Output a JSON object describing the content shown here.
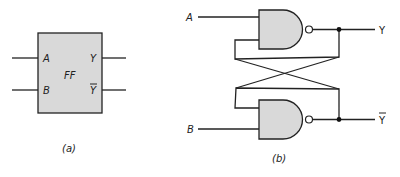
{
  "figure_a": {
    "block_label": "FF",
    "inputs": [
      "A",
      "B"
    ],
    "outputs": [
      "Y",
      "Y̅"
    ],
    "output_bar": "‾",
    "caption": "(a)",
    "fill_color": "#d9d9d9"
  },
  "figure_b": {
    "inputs": [
      "A",
      "B"
    ],
    "outputs": [
      "Y",
      "Y"
    ],
    "output_bottom_overbar": true,
    "gates": [
      "NAND",
      "NAND"
    ],
    "caption": "(b)",
    "fill_color": "#d9d9d9"
  }
}
